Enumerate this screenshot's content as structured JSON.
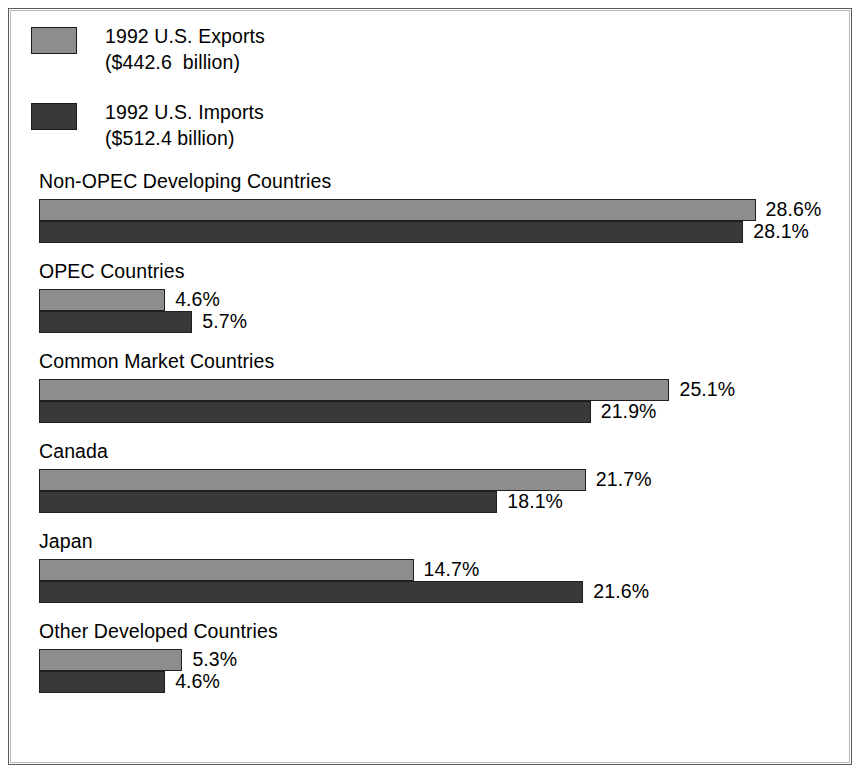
{
  "legend": {
    "items": [
      {
        "key": "exports",
        "line1": "1992 U.S. Exports",
        "line2": "($442.6  billion)",
        "color": "#8d8d8d"
      },
      {
        "key": "imports",
        "line1": "1992 U.S. Imports",
        "line2": "($512.4 billion)",
        "color": "#393939"
      }
    ]
  },
  "chart_data": {
    "type": "bar",
    "orientation": "horizontal",
    "title": "",
    "subtitle": "",
    "xlabel": "",
    "ylabel": "",
    "grid": false,
    "legend_position": "top-left",
    "value_suffix": "%",
    "xlim": [
      0,
      30
    ],
    "categories": [
      "Non-OPEC Developing Countries",
      "OPEC Countries",
      "Common Market Countries",
      "Canada",
      "Japan",
      "Other Developed Countries"
    ],
    "series": [
      {
        "name": "1992 U.S. Exports",
        "color": "#8d8d8d",
        "values": [
          28.6,
          4.6,
          25.1,
          21.7,
          14.7,
          5.3
        ],
        "labels": [
          "28.6%",
          "4.6%",
          "25.1%",
          "21.7%",
          "14.7%",
          "5.3%"
        ]
      },
      {
        "name": "1992 U.S. Imports",
        "color": "#393939",
        "values": [
          28.1,
          5.7,
          21.9,
          18.1,
          21.6,
          4.6
        ],
        "labels": [
          "28.1%",
          "5.7%",
          "21.9%",
          "18.1%",
          "21.6%",
          "4.6%"
        ]
      }
    ]
  }
}
